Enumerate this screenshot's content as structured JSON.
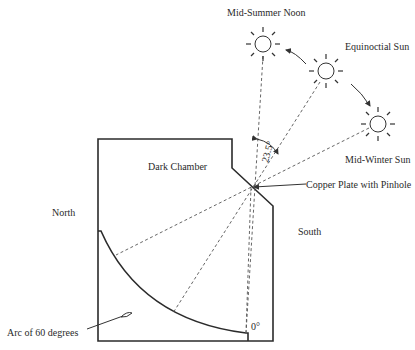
{
  "figure": {
    "type": "camera obscura meridian instrument diagram",
    "labels": {
      "mid_summer": "Mid-Summer Noon",
      "equinoctial": "Equinoctial Sun",
      "mid_winter": "Mid-Winter Sun",
      "dark_chamber": "Dark Chamber",
      "copper_plate": "Copper Plate with Pinhole",
      "north": "North",
      "south": "South",
      "arc": "Arc of 60 degrees",
      "zero": "0°",
      "angle": "23.5°"
    },
    "suns": [
      {
        "name": "mid-summer-noon-sun",
        "cx": 263,
        "cy": 44
      },
      {
        "name": "equinoctial-sun",
        "cx": 326,
        "cy": 71
      },
      {
        "name": "mid-winter-sun",
        "cx": 378,
        "cy": 124
      }
    ],
    "pinhole": {
      "x": 251,
      "y": 187
    },
    "colors": {
      "line": "#2b2b2b",
      "background": "#ffffff"
    }
  }
}
